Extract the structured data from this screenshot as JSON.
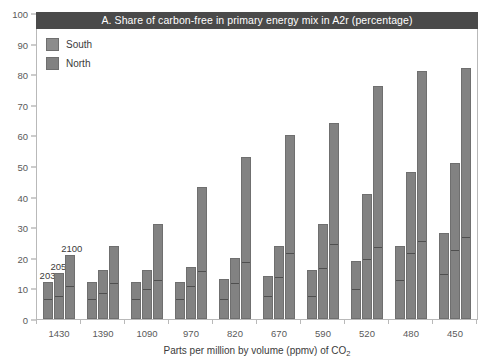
{
  "chart_data": {
    "type": "bar",
    "title": "A.  Share of carbon-free in primary energy mix in A2r (percentage)",
    "xlabel": "Parts per million by volume (ppmv) of CO2",
    "xlabel_prefix": "Parts per million by volume (ppmv) of CO",
    "xlabel_subscript": "2",
    "ylabel": "",
    "ylim": [
      0,
      100
    ],
    "yticks": [
      0,
      10,
      20,
      30,
      40,
      50,
      60,
      70,
      80,
      90,
      100
    ],
    "grid": false,
    "legend_position": "top-left",
    "stacked": true,
    "categories": [
      "1430",
      "1390",
      "1090",
      "970",
      "820",
      "670",
      "590",
      "520",
      "480",
      "450"
    ],
    "subcategories": [
      "2030",
      "2050",
      "2100"
    ],
    "annotations": [
      {
        "text": "2030",
        "group": "1430",
        "bar": "2030"
      },
      {
        "text": "2050",
        "group": "1430",
        "bar": "2050"
      },
      {
        "text": "2100",
        "group": "1430",
        "bar": "2100"
      }
    ],
    "series": [
      {
        "name": "North",
        "color": "#828282"
      },
      {
        "name": "South",
        "color": "#8c8c8c"
      }
    ],
    "groups": [
      {
        "category": "1430",
        "bars": [
          {
            "label": "2030",
            "total": 12,
            "north": 6
          },
          {
            "label": "2050",
            "total": 15,
            "north": 7
          },
          {
            "label": "2100",
            "total": 21,
            "north": 10
          }
        ]
      },
      {
        "category": "1390",
        "bars": [
          {
            "label": "2030",
            "total": 12,
            "north": 6
          },
          {
            "label": "2050",
            "total": 16,
            "north": 8
          },
          {
            "label": "2100",
            "total": 24,
            "north": 11
          }
        ]
      },
      {
        "category": "1090",
        "bars": [
          {
            "label": "2030",
            "total": 12,
            "north": 6
          },
          {
            "label": "2050",
            "total": 16,
            "north": 9
          },
          {
            "label": "2100",
            "total": 31,
            "north": 12
          }
        ]
      },
      {
        "category": "970",
        "bars": [
          {
            "label": "2030",
            "total": 12,
            "north": 6
          },
          {
            "label": "2050",
            "total": 17,
            "north": 10
          },
          {
            "label": "2100",
            "total": 43,
            "north": 15
          }
        ]
      },
      {
        "category": "820",
        "bars": [
          {
            "label": "2030",
            "total": 13,
            "north": 6
          },
          {
            "label": "2050",
            "total": 20,
            "north": 11
          },
          {
            "label": "2100",
            "total": 53,
            "north": 18
          }
        ]
      },
      {
        "category": "670",
        "bars": [
          {
            "label": "2030",
            "total": 14,
            "north": 7
          },
          {
            "label": "2050",
            "total": 24,
            "north": 13
          },
          {
            "label": "2100",
            "total": 60,
            "north": 21
          }
        ]
      },
      {
        "category": "590",
        "bars": [
          {
            "label": "2030",
            "total": 16,
            "north": 7
          },
          {
            "label": "2050",
            "total": 31,
            "north": 16
          },
          {
            "label": "2100",
            "total": 64,
            "north": 24
          }
        ]
      },
      {
        "category": "520",
        "bars": [
          {
            "label": "2030",
            "total": 19,
            "north": 9
          },
          {
            "label": "2050",
            "total": 41,
            "north": 19
          },
          {
            "label": "2100",
            "total": 76,
            "north": 23
          }
        ]
      },
      {
        "category": "480",
        "bars": [
          {
            "label": "2030",
            "total": 24,
            "north": 12
          },
          {
            "label": "2050",
            "total": 48,
            "north": 21
          },
          {
            "label": "2100",
            "total": 81,
            "north": 25
          }
        ]
      },
      {
        "category": "450",
        "bars": [
          {
            "label": "2030",
            "total": 28,
            "north": 14
          },
          {
            "label": "2050",
            "total": 51,
            "north": 22
          },
          {
            "label": "2100",
            "total": 82,
            "north": 26
          }
        ]
      }
    ]
  },
  "legend": {
    "items": [
      {
        "label": "South",
        "color": "#8c8c8c"
      },
      {
        "label": "North",
        "color": "#828282"
      }
    ]
  },
  "colors": {
    "bar_fill": "#828282",
    "bar_stroke": "#6f6f6f",
    "split_line": "#4f4f4f",
    "title_bar": "#4a4a4a",
    "title_text": "#ffffff",
    "axis": "#b9b9b9",
    "tick_text": "#5a5a5a",
    "background": "#ffffff"
  }
}
